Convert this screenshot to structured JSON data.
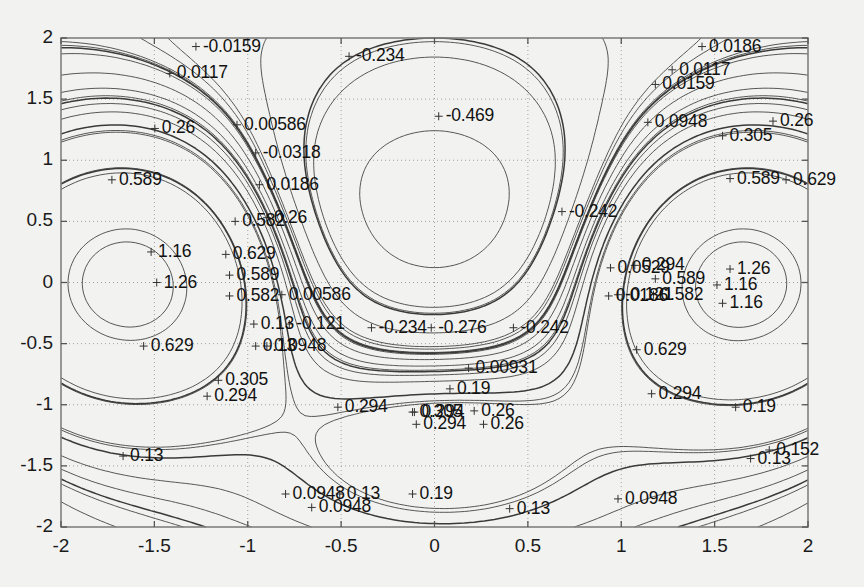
{
  "figure": {
    "background_color": "#f2f2f0",
    "plot_background_color": "#f2f2f0",
    "axis_color": "#808080",
    "contour_color": "#3a3a3a",
    "grid_color": "#a0a0a0"
  },
  "chart_data": {
    "type": "line",
    "subtype": "contour",
    "title": "",
    "xlabel": "",
    "ylabel": "",
    "xlim": [
      -2,
      2
    ],
    "ylim": [
      -2,
      2
    ],
    "grid": true,
    "grid_style": "dotted",
    "legend": false,
    "xticks": [
      -2,
      -1.5,
      -1,
      -0.5,
      0,
      0.5,
      1,
      1.5,
      2
    ],
    "xticklabels": [
      "-2",
      "-1.5",
      "-1",
      "-0.5",
      "0",
      "0.5",
      "1",
      "1.5",
      "2"
    ],
    "yticks": [
      -2,
      -1.5,
      -1,
      -0.5,
      0,
      0.5,
      1,
      1.5,
      2
    ],
    "yticklabels": [
      "-2",
      "-1.5",
      "-1",
      "-0.5",
      "0",
      "0.5",
      "1",
      "1.5",
      "2"
    ],
    "contour_levels": [
      -0.469,
      -0.276,
      -0.242,
      -0.234,
      -0.121,
      -0.0318,
      -0.0159,
      0.00586,
      0.00931,
      0.0117,
      0.0186,
      0.0529,
      0.0948,
      0.121,
      0.13,
      0.152,
      0.19,
      0.26,
      0.294,
      0.305,
      0.582,
      0.589,
      0.629,
      1.16,
      1.26
    ],
    "inline_labels": [
      {
        "text": "-0.0159",
        "x": -1.24,
        "y": 1.93
      },
      {
        "text": "0.0117",
        "x": -1.38,
        "y": 1.71
      },
      {
        "text": "-0.234",
        "x": -0.42,
        "y": 1.85
      },
      {
        "text": "0.0186",
        "x": 1.47,
        "y": 1.93
      },
      {
        "text": "0.0117",
        "x": 1.31,
        "y": 1.74
      },
      {
        "text": "0.0159",
        "x": 1.22,
        "y": 1.62
      },
      {
        "text": "0.26",
        "x": -1.46,
        "y": 1.26
      },
      {
        "text": "0.00586",
        "x": -1.02,
        "y": 1.29
      },
      {
        "text": "-0.469",
        "x": 0.06,
        "y": 1.36
      },
      {
        "text": "0.0948",
        "x": 1.18,
        "y": 1.31
      },
      {
        "text": "0.26",
        "x": 1.85,
        "y": 1.32
      },
      {
        "text": "0.305",
        "x": 1.58,
        "y": 1.2
      },
      {
        "text": "0.589",
        "x": -1.69,
        "y": 0.84
      },
      {
        "text": "-0.0318",
        "x": -0.92,
        "y": 1.06
      },
      {
        "text": "0.589",
        "x": 1.62,
        "y": 0.85
      },
      {
        "text": "0.629",
        "x": 1.92,
        "y": 0.84
      },
      {
        "text": "0.0186",
        "x": -0.9,
        "y": 0.8
      },
      {
        "text": "0.582",
        "x": -1.03,
        "y": 0.5
      },
      {
        "text": "0.26",
        "x": -0.86,
        "y": 0.53
      },
      {
        "text": "-0.242",
        "x": 0.72,
        "y": 0.58
      },
      {
        "text": "1.16",
        "x": -1.48,
        "y": 0.25
      },
      {
        "text": "0.629",
        "x": -1.08,
        "y": 0.23
      },
      {
        "text": "0.0529",
        "x": 0.98,
        "y": 0.12
      },
      {
        "text": "0.294",
        "x": 1.11,
        "y": 0.14
      },
      {
        "text": "1.26",
        "x": 1.62,
        "y": 0.11
      },
      {
        "text": "1.26",
        "x": -1.45,
        "y": 0.0
      },
      {
        "text": "0.589",
        "x": -1.06,
        "y": 0.06
      },
      {
        "text": "0.589",
        "x": 1.22,
        "y": 0.03
      },
      {
        "text": "1.16",
        "x": 1.55,
        "y": -0.02
      },
      {
        "text": "0.582",
        "x": -1.06,
        "y": -0.11
      },
      {
        "text": "0.00586",
        "x": -0.78,
        "y": -0.1
      },
      {
        "text": "-0.121",
        "x": 1.02,
        "y": -0.1
      },
      {
        "text": "0.0186",
        "x": 0.97,
        "y": -0.11
      },
      {
        "text": "0.582",
        "x": 1.21,
        "y": -0.1
      },
      {
        "text": "1.16",
        "x": 1.58,
        "y": -0.17
      },
      {
        "text": "0.13",
        "x": -0.93,
        "y": -0.34
      },
      {
        "text": "-0.121",
        "x": -0.74,
        "y": -0.34
      },
      {
        "text": "-0.234",
        "x": -0.3,
        "y": -0.37
      },
      {
        "text": "-0.276",
        "x": 0.02,
        "y": -0.37
      },
      {
        "text": "-0.242",
        "x": 0.46,
        "y": -0.37
      },
      {
        "text": "0.629",
        "x": -1.52,
        "y": -0.52
      },
      {
        "text": "0.0948",
        "x": -0.86,
        "y": -0.52
      },
      {
        "text": "0.13",
        "x": -0.92,
        "y": -0.52
      },
      {
        "text": "0.629",
        "x": 1.12,
        "y": -0.55
      },
      {
        "text": "0.00931",
        "x": 0.22,
        "y": -0.7
      },
      {
        "text": "0.305",
        "x": -1.12,
        "y": -0.8
      },
      {
        "text": "0.294",
        "x": -1.18,
        "y": -0.93
      },
      {
        "text": "0.19",
        "x": 0.12,
        "y": -0.87
      },
      {
        "text": "0.294",
        "x": 1.2,
        "y": -0.91
      },
      {
        "text": "0.19",
        "x": 1.65,
        "y": -1.02
      },
      {
        "text": "0.294",
        "x": -0.48,
        "y": -1.02
      },
      {
        "text": "0.305",
        "x": -0.08,
        "y": -1.06
      },
      {
        "text": "0.294",
        "x": -0.07,
        "y": -1.06
      },
      {
        "text": "0.26",
        "x": 0.25,
        "y": -1.05
      },
      {
        "text": "0.294",
        "x": -0.06,
        "y": -1.16
      },
      {
        "text": "0.26",
        "x": 0.3,
        "y": -1.16
      },
      {
        "text": "0.13",
        "x": -1.63,
        "y": -1.42
      },
      {
        "text": "0.152",
        "x": 1.83,
        "y": -1.37
      },
      {
        "text": "0.13",
        "x": 1.73,
        "y": -1.44
      },
      {
        "text": "0.0948",
        "x": -0.76,
        "y": -1.73
      },
      {
        "text": "0.13",
        "x": -0.47,
        "y": -1.73
      },
      {
        "text": "0.19",
        "x": -0.08,
        "y": -1.73
      },
      {
        "text": "0.0948",
        "x": -0.62,
        "y": -1.84
      },
      {
        "text": "0.13",
        "x": 0.44,
        "y": -1.85
      },
      {
        "text": "0.0948",
        "x": 1.02,
        "y": -1.77
      }
    ]
  }
}
